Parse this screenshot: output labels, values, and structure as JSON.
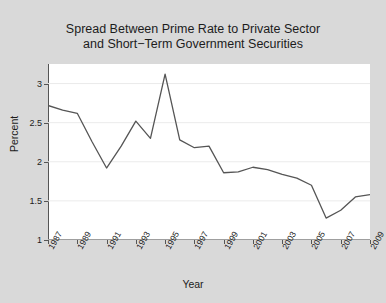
{
  "chart_data": {
    "type": "line",
    "title": "Spread Between Prime Rate to Private Sector\nand Short−Term Government Securities",
    "xlabel": "Year",
    "ylabel": "Percent",
    "xlim": [
      1987,
      2009
    ],
    "ylim": [
      1,
      3.25
    ],
    "yticks": [
      1,
      1.5,
      2,
      2.5,
      3
    ],
    "ytick_labels": [
      "1",
      "1.5",
      "2",
      "2.5",
      "3"
    ],
    "xticks": [
      1987,
      1989,
      1991,
      1993,
      1995,
      1997,
      1999,
      2001,
      2003,
      2005,
      2007,
      2009
    ],
    "xtick_labels": [
      "1987",
      "1989",
      "1991",
      "1993",
      "1995",
      "1997",
      "1999",
      "2001",
      "2003",
      "2005",
      "2007",
      "2009"
    ],
    "grid": true,
    "legend": false,
    "line_color": "#555555",
    "background_color": "#d9d9d9",
    "plot_background_color": "#ffffff",
    "x": [
      1987,
      1988,
      1989,
      1990,
      1991,
      1992,
      1993,
      1994,
      1995,
      1996,
      1997,
      1998,
      1999,
      2000,
      2001,
      2002,
      2003,
      2004,
      2005,
      2006,
      2007,
      2008,
      2009
    ],
    "values": [
      2.72,
      2.66,
      2.62,
      2.26,
      1.92,
      2.2,
      2.52,
      2.3,
      3.12,
      2.28,
      2.18,
      2.2,
      1.86,
      1.87,
      1.93,
      1.9,
      1.84,
      1.79,
      1.7,
      1.28,
      1.38,
      1.55,
      1.58
    ]
  }
}
